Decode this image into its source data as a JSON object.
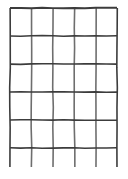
{
  "figure": {
    "background_color": "#ffffff",
    "line_color": "#3c3c3c",
    "line_color_light": "#6e6e6e",
    "width": 128,
    "height": 179
  },
  "chart_data": {
    "type": "table",
    "title": "",
    "xlabel": "",
    "ylabel": "",
    "grid": true,
    "columns": 5,
    "rows": 5,
    "partial_bottom_row": true,
    "vertical_lines_x": [
      10,
      31.5,
      53,
      74.5,
      96,
      117
    ],
    "horizontal_lines_y": [
      8,
      36,
      64,
      92,
      120,
      148
    ],
    "vertical_extent_y": [
      8,
      167
    ],
    "horizontal_extent_x": [
      10,
      117
    ],
    "cell_width": 21.4,
    "cell_height": 28,
    "stroke_width": 1.6,
    "cells": [
      [
        "",
        "",
        "",
        "",
        ""
      ],
      [
        "",
        "",
        "",
        "",
        ""
      ],
      [
        "",
        "",
        "",
        "",
        ""
      ],
      [
        "",
        "",
        "",
        "",
        ""
      ],
      [
        "",
        "",
        "",
        "",
        ""
      ],
      [
        "",
        "",
        "",
        "",
        ""
      ]
    ]
  },
  "legend": {
    "visible": false,
    "entries": []
  },
  "annotations": []
}
